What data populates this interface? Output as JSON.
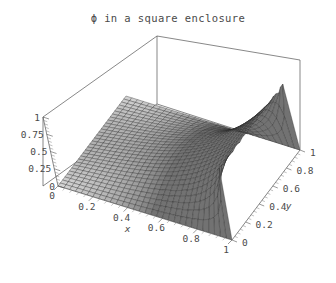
{
  "figure": {
    "title": "ϕ in a square enclosure",
    "background_color": "#ffffff",
    "text_color": "#4a4a4a",
    "frame_color": "#555555"
  },
  "chart_data": {
    "type": "surface",
    "title": "ϕ in a square enclosure",
    "xlabel": "x",
    "ylabel": "y",
    "zlabel": "",
    "xlim": [
      0,
      1
    ],
    "ylim": [
      0,
      1
    ],
    "zlim": [
      0,
      1
    ],
    "xticks": [
      "0",
      "0.2",
      "0.4",
      "0.6",
      "0.8",
      "1"
    ],
    "yticks": [
      "0",
      "0.2",
      "0.4",
      "0.6",
      "0.8",
      "1"
    ],
    "zticks": [
      "0",
      "0.25",
      "0.5",
      "0.75",
      "1"
    ],
    "xtick_values": [
      0,
      0.2,
      0.4,
      0.6,
      0.8,
      1
    ],
    "ytick_values": [
      0,
      0.2,
      0.4,
      0.6,
      0.8,
      1
    ],
    "ztick_values": [
      0,
      0.25,
      0.5,
      0.75,
      1
    ],
    "grid": false,
    "legend": false,
    "mesh": true,
    "mesh_n": 30,
    "surface_fill": "#b4b4b4",
    "mesh_line_color": "#2b2b2b",
    "z_samples": {
      "comment": "phi(x,y) on a coarse 6x6 readout grid, x across rows, y across columns",
      "x": [
        0,
        0.2,
        0.4,
        0.6,
        0.8,
        1
      ],
      "y": [
        0,
        0.2,
        0.4,
        0.6,
        0.8,
        1
      ],
      "values": [
        [
          0,
          0,
          0,
          0,
          0,
          0
        ],
        [
          0,
          0.01,
          0.02,
          0.02,
          0.01,
          0
        ],
        [
          0,
          0.03,
          0.06,
          0.06,
          0.03,
          0
        ],
        [
          0,
          0.09,
          0.17,
          0.17,
          0.09,
          0
        ],
        [
          0,
          0.26,
          0.45,
          0.45,
          0.26,
          0
        ],
        [
          0,
          1,
          1,
          1,
          1,
          0
        ]
      ]
    }
  },
  "axes": {
    "x": {
      "label": "x",
      "ticks": [
        "0",
        "0.2",
        "0.4",
        "0.6",
        "0.8",
        "1"
      ]
    },
    "y": {
      "label": "y",
      "ticks": [
        "0",
        "0.2",
        "0.4",
        "0.6",
        "0.8",
        "1"
      ]
    },
    "z": {
      "label": "",
      "ticks": [
        "1",
        "0.75",
        "0.5",
        "0.25",
        "0"
      ]
    }
  }
}
